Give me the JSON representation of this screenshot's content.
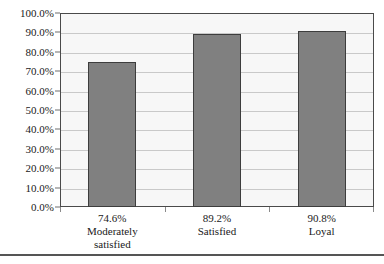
{
  "chart_data": {
    "type": "bar",
    "title": "",
    "subtitle": "",
    "xlabel": "",
    "ylabel": "",
    "ylim": [
      0,
      100
    ],
    "grid": true,
    "legend": false,
    "orientation": "vertical",
    "bar_color": "#808080",
    "bar_edge_color": "#3d3d3d",
    "plot_background": "#f7f7f7",
    "gridline_color": "#c9c9c9",
    "frame_color": "#4a4a4a",
    "categories": [
      "Moderately satisfied",
      "Satisfied",
      "Loyal"
    ],
    "values": [
      74.6,
      89.2,
      90.8
    ],
    "value_labels": [
      "74.6%",
      "89.2%",
      "90.8%"
    ],
    "category_lines": [
      [
        "74.6%",
        "Moderately",
        "satisfied"
      ],
      [
        "89.2%",
        "Satisfied"
      ],
      [
        "90.8%",
        "Loyal"
      ]
    ],
    "ytick_values": [
      0,
      10,
      20,
      30,
      40,
      50,
      60,
      70,
      80,
      90,
      100
    ],
    "ytick_labels": [
      "0.0%",
      "10.0%",
      "20.0%",
      "30.0%",
      "40.0%",
      "50.0%",
      "60.0%",
      "70.0%",
      "80.0%",
      "90.0%",
      "100.0%"
    ]
  }
}
